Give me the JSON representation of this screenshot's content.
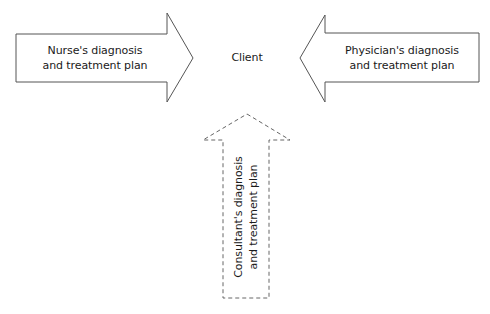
{
  "diagram": {
    "center": {
      "label": "Client"
    },
    "arrows": [
      {
        "id": "nurse",
        "direction": "right",
        "style": "solid",
        "lines": [
          "Nurse's diagnosis",
          "and treatment plan"
        ]
      },
      {
        "id": "physician",
        "direction": "left",
        "style": "solid",
        "lines": [
          "Physician's diagnosis",
          "and treatment plan"
        ]
      },
      {
        "id": "consultant",
        "direction": "up",
        "style": "dashed",
        "lines": [
          "Consultant's diagnosis",
          "and treatment plan"
        ]
      }
    ],
    "colors": {
      "stroke": "#555555",
      "text": "#1a1a1a",
      "background": "#ffffff"
    }
  }
}
